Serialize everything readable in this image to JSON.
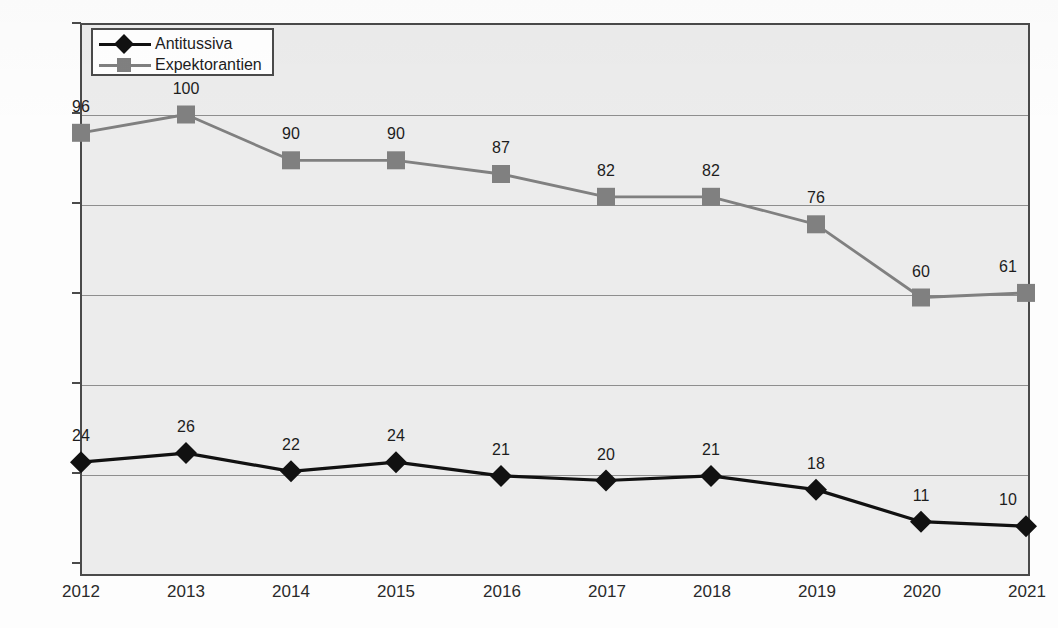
{
  "chart_data": {
    "type": "line",
    "title": "",
    "xlabel": "",
    "ylabel": "(Mio. DDD)",
    "categories": [
      "2012",
      "2013",
      "2014",
      "2015",
      "2016",
      "2017",
      "2018",
      "2019",
      "2020",
      "2021"
    ],
    "ylim": [
      0,
      120
    ],
    "yticks": [
      0,
      20,
      40,
      60,
      80,
      100,
      120
    ],
    "ytick_labels": [
      "0",
      "20",
      "40",
      "60",
      "80",
      "100",
      "120"
    ],
    "grid": true,
    "legend_position": "top-left",
    "series": [
      {
        "name": "Antitussiva",
        "color": "#111111",
        "marker": "diamond",
        "values": [
          24,
          26,
          22,
          24,
          21,
          20,
          21,
          18,
          11,
          10
        ],
        "labels": [
          "24",
          "26",
          "22",
          "24",
          "21",
          "20",
          "21",
          "18",
          "11",
          "10"
        ]
      },
      {
        "name": "Expektorantien",
        "color": "#808080",
        "marker": "square",
        "values": [
          96,
          100,
          90,
          90,
          87,
          82,
          82,
          76,
          60,
          61
        ],
        "labels": [
          "96",
          "100",
          "90",
          "90",
          "87",
          "82",
          "82",
          "76",
          "60",
          "61"
        ]
      }
    ]
  },
  "legend": {
    "items": [
      {
        "label": "Antitussiva",
        "color": "#111111",
        "marker": "diamond"
      },
      {
        "label": "Expektorantien",
        "color": "#808080",
        "marker": "square"
      }
    ]
  },
  "axis": {
    "y_title": "(Mio. DDD)"
  }
}
